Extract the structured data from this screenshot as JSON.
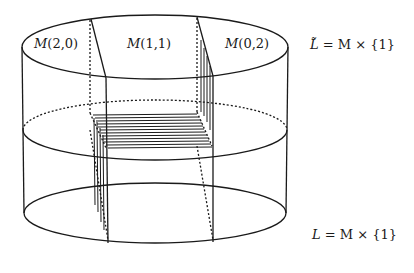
{
  "diagram": {
    "type": "cylinder-decomposition",
    "regions": [
      {
        "id": "m20",
        "label_name": "M",
        "label_args": "(2,0)"
      },
      {
        "id": "m11",
        "label_name": "M",
        "label_args": "(1,1)"
      },
      {
        "id": "m02",
        "label_name": "M",
        "label_args": "(0,2)"
      }
    ],
    "top_label": {
      "lhs": "L̃",
      "rhs": "= M × {1}"
    },
    "bottom_label": {
      "lhs": "L",
      "rhs": "= M × {1}"
    },
    "colors": {
      "stroke": "#1a1a1a",
      "background": "#ffffff"
    }
  }
}
